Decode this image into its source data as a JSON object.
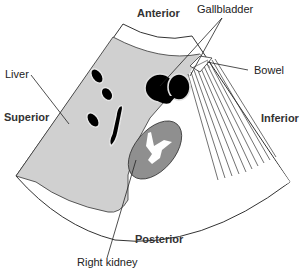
{
  "diagram": {
    "type": "ultrasound-sector-schematic",
    "orientation_labels": {
      "anterior": "Anterior",
      "posterior": "Posterior",
      "superior": "Superior",
      "inferior": "Inferior"
    },
    "structure_labels": {
      "liver": "Liver",
      "gallbladder": "Gallbladder",
      "bowel": "Bowel",
      "right_kidney": "Right kidney"
    },
    "colors": {
      "liver_fill": "#d0d0d0",
      "kidney_fill": "#8f8f8f",
      "kidney_sinus": "#ffffff",
      "gallbladder_fill": "#000000",
      "vessel_fill": "#000000",
      "outline": "#333333",
      "background": "#ffffff"
    }
  }
}
